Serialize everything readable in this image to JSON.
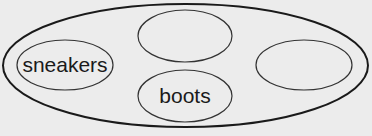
{
  "diagram": {
    "type": "nested-ellipses",
    "outer": {
      "label": ""
    },
    "inner": [
      {
        "label": "sneakers"
      },
      {
        "label": ""
      },
      {
        "label": "boots"
      },
      {
        "label": ""
      }
    ]
  },
  "colors": {
    "background": "#ececec",
    "stroke": "#1a1a1a"
  }
}
